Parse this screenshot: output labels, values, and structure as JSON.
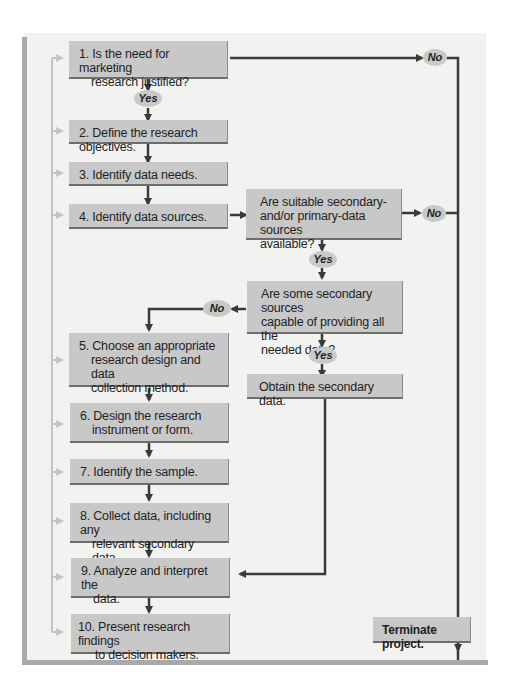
{
  "figure": {
    "header_fragment": "",
    "steps": [
      {
        "id": "step-1",
        "lines": [
          "1. Is the need for marketing",
          "research justified?"
        ]
      },
      {
        "id": "step-2",
        "lines": [
          "2. Define the research objectives."
        ]
      },
      {
        "id": "step-3",
        "lines": [
          "3. Identify data needs."
        ]
      },
      {
        "id": "step-4",
        "lines": [
          "4. Identify data sources."
        ]
      },
      {
        "id": "step-5",
        "lines": [
          "5. Choose an appropriate",
          "research design and data",
          "collection method."
        ]
      },
      {
        "id": "step-6",
        "lines": [
          "6. Design the research",
          "instrument or form."
        ]
      },
      {
        "id": "step-7",
        "lines": [
          "7. Identify the sample."
        ]
      },
      {
        "id": "step-8",
        "lines": [
          "8. Collect data, including any",
          "relevant secondary data."
        ]
      },
      {
        "id": "step-9",
        "lines": [
          "9. Analyze and interpret the",
          "data."
        ]
      },
      {
        "id": "step-10",
        "lines": [
          "10. Present research findings",
          "to decision makers."
        ]
      }
    ],
    "decisions": [
      {
        "id": "sources-available",
        "lines": [
          "Are suitable secondary-",
          "and/or primary-data sources",
          "available?"
        ]
      },
      {
        "id": "secondary-sufficient",
        "lines": [
          "Are some secondary sources",
          "capable of providing all the",
          "needed data?"
        ]
      }
    ],
    "actions": {
      "obtain_secondary": "Obtain the secondary data.",
      "terminate": "Terminate project."
    },
    "labels": {
      "yes": "Yes",
      "no": "No"
    },
    "colors": {
      "box_fill": "#c8c8c8",
      "arrow_dark": "#3a3a3a",
      "feedback_arrow": "#c4c4c4",
      "panel_bg": "#f2f2f0",
      "panel_border": "#a9a9a9"
    }
  }
}
